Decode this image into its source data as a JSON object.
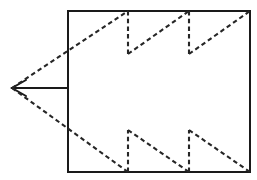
{
  "figure": {
    "canvas": {
      "width": 257,
      "height": 180,
      "background_color": "#ffffff"
    },
    "colors": {
      "solid_line": "#1a1a1a",
      "dashed_line": "#262626",
      "background": "#ffffff"
    },
    "rectangle": {
      "name": "main-frame",
      "left": 68,
      "top": 11,
      "right": 250,
      "bottom": 172,
      "stroke_width": 2,
      "style": "solid"
    },
    "apex": {
      "name": "left-apex",
      "x": 12,
      "y": 88,
      "arrow_direction": "left"
    },
    "axis_line": {
      "name": "apex-axis",
      "x1": 12,
      "y1": 88,
      "x2": 68,
      "y2": 88,
      "style": "solid"
    },
    "arrow_head": {
      "name": "apex-arrowhead",
      "points": "26,80 12,88 26,96"
    },
    "upper_sawtooth": {
      "name": "upper-sawtooth",
      "style": "dashed",
      "baseline_y": 54,
      "peak_y": 11,
      "segments": [
        {
          "type": "ramp",
          "x1": 12,
          "y1": 88,
          "x2": 128,
          "y2": 11
        },
        {
          "type": "drop",
          "x1": 128,
          "y1": 11,
          "x2": 128,
          "y2": 54
        },
        {
          "type": "ramp",
          "x1": 128,
          "y1": 54,
          "x2": 189,
          "y2": 11
        },
        {
          "type": "drop",
          "x1": 189,
          "y1": 11,
          "x2": 189,
          "y2": 54
        },
        {
          "type": "ramp",
          "x1": 189,
          "y1": 54,
          "x2": 250,
          "y2": 11
        }
      ]
    },
    "lower_sawtooth": {
      "name": "lower-sawtooth",
      "style": "dashed",
      "baseline_y": 130,
      "trough_y": 172,
      "segments": [
        {
          "type": "ramp",
          "x1": 12,
          "y1": 88,
          "x2": 128,
          "y2": 172
        },
        {
          "type": "rise",
          "x1": 128,
          "y1": 172,
          "x2": 128,
          "y2": 130
        },
        {
          "type": "ramp",
          "x1": 128,
          "y1": 130,
          "x2": 189,
          "y2": 172
        },
        {
          "type": "rise",
          "x1": 189,
          "y1": 172,
          "x2": 189,
          "y2": 130
        },
        {
          "type": "ramp",
          "x1": 189,
          "y1": 130,
          "x2": 250,
          "y2": 172
        }
      ]
    },
    "dash_pattern": {
      "dash_length": 4.5,
      "gap_length": 3.2,
      "stroke_width": 2.1
    }
  }
}
